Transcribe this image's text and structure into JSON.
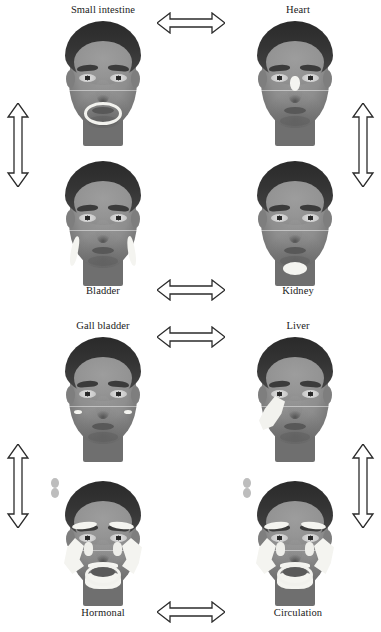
{
  "figure": {
    "background_color": "#ffffff",
    "text_color": "#1a1a1a",
    "highlight_color": "#f2f2ee",
    "arrow_stroke_color": "#2b2b2b",
    "arrow_fill_color": "#ffffff"
  },
  "panels": [
    {
      "id": "small-intestine",
      "label": "Small intestine",
      "label_position": "above",
      "zone_description": "ring around the mouth"
    },
    {
      "id": "heart",
      "label": "Heart",
      "label_position": "above",
      "zone_description": "bridge of the nose"
    },
    {
      "id": "bladder",
      "label": "Bladder",
      "label_position": "below",
      "zone_description": "paired vertical crescents on the lower cheeks"
    },
    {
      "id": "kidney",
      "label": "Kidney",
      "label_position": "below",
      "zone_description": "oval below the chin"
    },
    {
      "id": "gall-bladder",
      "label": "Gall bladder",
      "label_position": "above",
      "zone_description": "small paired dots on the mid cheeks"
    },
    {
      "id": "liver",
      "label": "Liver",
      "label_position": "above",
      "zone_description": "large swoosh over the right cheek"
    },
    {
      "id": "hormonal",
      "label": "Hormonal",
      "label_position": "below",
      "zone_description": "brows, cheeks, upper lip, chin and mouth outline"
    },
    {
      "id": "circulation",
      "label": "Circulation",
      "label_position": "below",
      "zone_description": "brows, cheeks, upper lip, chin and mouth outline"
    }
  ],
  "connectors": [
    {
      "id": "small-intestine-heart",
      "orientation": "horizontal",
      "style": "double-headed"
    },
    {
      "id": "small-intestine-bladder",
      "orientation": "vertical",
      "style": "double-headed"
    },
    {
      "id": "heart-kidney",
      "orientation": "vertical",
      "style": "double-headed"
    },
    {
      "id": "bladder-kidney",
      "orientation": "horizontal",
      "style": "double-headed"
    },
    {
      "id": "gall-bladder-liver",
      "orientation": "horizontal",
      "style": "double-headed"
    },
    {
      "id": "gall-bladder-hormonal",
      "orientation": "vertical",
      "style": "double-headed"
    },
    {
      "id": "liver-circulation",
      "orientation": "vertical",
      "style": "double-headed"
    },
    {
      "id": "hormonal-circulation",
      "orientation": "horizontal",
      "style": "double-headed"
    }
  ]
}
